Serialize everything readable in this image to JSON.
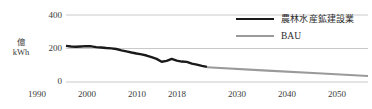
{
  "chart_data": {
    "type": "line",
    "title": "",
    "xlabel": "",
    "ylabel": "億kWh",
    "ylabel_lines": [
      "億",
      "kWh"
    ],
    "xlim": [
      1990,
      2050
    ],
    "ylim": [
      0,
      400
    ],
    "grid": true,
    "grid_axis": "y",
    "legend_position": "top-right",
    "yticks": [
      0,
      200,
      400
    ],
    "ytick_labels": [
      "0",
      "200",
      "400"
    ],
    "xticks": [
      1990,
      2000,
      2010,
      2018,
      2030,
      2040,
      2050
    ],
    "xtick_labels": [
      "1990",
      "2000",
      "2010",
      "2018",
      "2030",
      "2040",
      "2050"
    ],
    "series": [
      {
        "name": "農林水産鉱建設業",
        "color": "#1a1a1a",
        "x": [
          1990,
          1991,
          1992,
          1993,
          1994,
          1995,
          1996,
          1997,
          1998,
          1999,
          2000,
          2001,
          2002,
          2003,
          2004,
          2005,
          2006,
          2007,
          2008,
          2009,
          2010,
          2011,
          2012,
          2013,
          2014,
          2015,
          2016,
          2017,
          2018
        ],
        "values": [
          216,
          212,
          210,
          212,
          214,
          213,
          208,
          206,
          203,
          201,
          197,
          189,
          183,
          176,
          170,
          165,
          158,
          148,
          138,
          121,
          126,
          138,
          128,
          122,
          120,
          110,
          104,
          96,
          90
        ]
      },
      {
        "name": "BAU",
        "color": "#9a9a9a",
        "x": [
          2018,
          2030,
          2040,
          2050
        ],
        "values": [
          88,
          68,
          52,
          36
        ]
      }
    ]
  },
  "legend": {
    "items": [
      {
        "label": "農林水産鉱建設業",
        "color": "#1a1a1a"
      },
      {
        "label": "BAU",
        "color": "#9a9a9a"
      }
    ]
  },
  "colors": {
    "series_main": "#1a1a1a",
    "series_bau": "#9a9a9a",
    "gridline": "#c9c9c9",
    "text": "#3a3a3a",
    "background": "#ffffff"
  }
}
